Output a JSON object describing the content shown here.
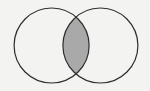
{
  "diagram": {
    "type": "venn",
    "sets": [
      {
        "id": "A",
        "label": "",
        "cx": 51.6,
        "cy": 45.5,
        "r": 37.5,
        "shaded": false
      },
      {
        "id": "B",
        "label": "",
        "cx": 100.4,
        "cy": 45.5,
        "r": 37.5,
        "shaded": false
      }
    ],
    "shaded_region": "A ∩ B",
    "colors": {
      "background": "#f3f3f1",
      "stroke": "#2e2e2e",
      "intersection_fill": "#a9a9a9",
      "set_fill": "#f3f3f1"
    }
  }
}
